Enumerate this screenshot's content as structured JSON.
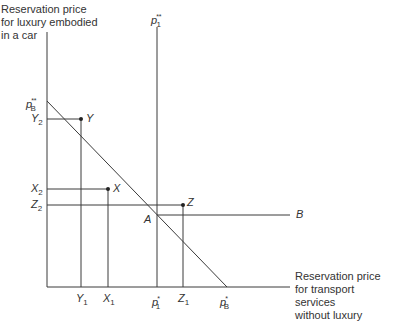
{
  "diagram": {
    "y_axis_title": [
      "Reservation price",
      "for luxury embodied",
      "in a car"
    ],
    "x_axis_title": [
      "Reservation price",
      "for transport services",
      "without luxury"
    ],
    "top_line_label": {
      "base": "p",
      "sub": "1",
      "sup": "**"
    },
    "y_ticks": [
      {
        "base": "p",
        "sub": "B",
        "sup": "**"
      },
      {
        "base": "Y",
        "sub": "2"
      },
      {
        "base": "X",
        "sub": "2"
      },
      {
        "base": "Z",
        "sub": "2"
      }
    ],
    "x_ticks": [
      {
        "base": "Y",
        "sub": "1"
      },
      {
        "base": "X",
        "sub": "1"
      },
      {
        "base": "p",
        "sub": "1",
        "sup": "*"
      },
      {
        "base": "Z",
        "sub": "1"
      },
      {
        "base": "p",
        "sub": "B",
        "sup": "*"
      }
    ],
    "points": [
      {
        "label": "Y"
      },
      {
        "label": "X"
      },
      {
        "label": "Z"
      }
    ],
    "intersection_label": "A",
    "line_end_label": "B",
    "colors": {
      "line": "#333333",
      "text": "#333333",
      "background": "#ffffff"
    }
  }
}
